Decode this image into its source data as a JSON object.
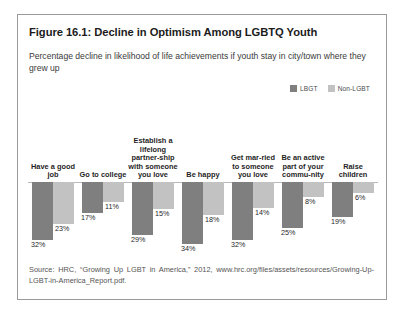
{
  "figure": {
    "title": "Figure 16.1: Decline in Optimism Among LGBTQ Youth",
    "subtitle": "Percentage decline in likelihood of life achievements if youth stay in city/town where they grew up",
    "source": "Source: HRC, “Growing Up LGBT in America,” 2012, www.hrc.org/files/assets/resources/Growing-Up-LGBT-in-America_Report.pdf."
  },
  "legend": {
    "entries": [
      {
        "label": "LBGT",
        "color": "#7f7f7f"
      },
      {
        "label": "Non-LGBT",
        "color": "#c2c2c2"
      }
    ]
  },
  "chart_data": {
    "type": "bar",
    "title": "Figure 16.1: Decline in Optimism Among LGBTQ Youth",
    "subtitle": "Percentage decline in likelihood of life achievements if youth stay in city/town where they grew up",
    "xlabel": "",
    "ylabel": "Percentage decline",
    "ylim": [
      0,
      34
    ],
    "grid": false,
    "orientation": "inverted-vertical",
    "legend_position": "top-right",
    "categories": [
      "Have a good job",
      "Go to college",
      "Establish a lifelong partner-ship with someone you love",
      "Be happy",
      "Get mar-ried to someone you love",
      "Be an active part of your commu-nity",
      "Raise children"
    ],
    "series": [
      {
        "name": "LBGT",
        "color": "#7f7f7f",
        "values": [
          32,
          17,
          29,
          34,
          32,
          25,
          19
        ],
        "value_labels": [
          "32%",
          "17%",
          "29%",
          "34%",
          "32%",
          "25%",
          "19%"
        ]
      },
      {
        "name": "Non-LGBT",
        "color": "#c2c2c2",
        "values": [
          23,
          11,
          15,
          18,
          14,
          8,
          6
        ],
        "value_labels": [
          "23%",
          "11%",
          "15%",
          "18%",
          "14%",
          "8%",
          "6%"
        ]
      }
    ]
  }
}
